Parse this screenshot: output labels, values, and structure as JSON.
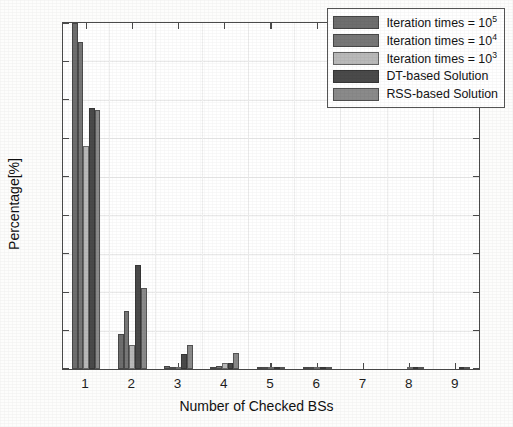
{
  "chart_data": {
    "type": "bar",
    "title": "",
    "xlabel": "Number of Checked BSs",
    "ylabel": "Percentage[%]",
    "categories": [
      "1",
      "2",
      "3",
      "4",
      "5",
      "6",
      "7",
      "8",
      "9"
    ],
    "ylim": [
      0,
      90
    ],
    "yticks": [
      0,
      10,
      20,
      30,
      40,
      50,
      60,
      70,
      80,
      90
    ],
    "grid": true,
    "legend_position": "top-right",
    "series": [
      {
        "name": "Iteration times = 10^5",
        "label": "Iteration times = 10",
        "exponent": "5",
        "color": "#6e6e6e",
        "values": [
          90,
          9.1,
          0.85,
          0.25,
          0.12,
          0.08,
          0,
          0,
          0
        ]
      },
      {
        "name": "Iteration times = 10^4",
        "label": "Iteration times = 10",
        "exponent": "4",
        "color": "#777777",
        "values": [
          85,
          15.1,
          0.45,
          0.9,
          0.3,
          0.4,
          0,
          0,
          0
        ]
      },
      {
        "name": "Iteration times = 10^3",
        "label": "Iteration times = 10",
        "exponent": "3",
        "color": "#b9b9b9",
        "values": [
          58,
          6.2,
          0.35,
          1.5,
          0.2,
          0.45,
          0,
          0.1,
          0
        ]
      },
      {
        "name": "DT-based Solution",
        "label": "DT-based Solution",
        "exponent": "",
        "color": "#4a4a4a",
        "values": [
          68,
          27,
          3.9,
          1.6,
          0.5,
          0.55,
          0,
          0.18,
          0.15
        ]
      },
      {
        "name": "RSS-based Solution",
        "label": "RSS-based Solution",
        "exponent": "",
        "color": "#8a8a8a",
        "values": [
          67.5,
          21.2,
          6.2,
          4.2,
          0.6,
          0.2,
          0,
          0.1,
          0.35
        ]
      }
    ]
  }
}
